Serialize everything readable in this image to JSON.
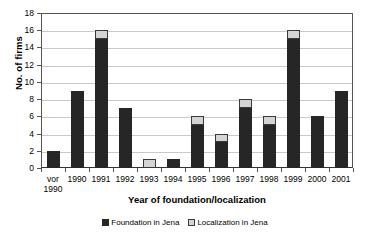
{
  "chart_data": {
    "type": "bar",
    "stacked": true,
    "title": "",
    "xlabel": "Year of foundation/localization",
    "ylabel": "No. of firms",
    "categories": [
      "vor\n1990",
      "1990",
      "1991",
      "1992",
      "1993",
      "1994",
      "1995",
      "1996",
      "1997",
      "1998",
      "1999",
      "2000",
      "2001"
    ],
    "series": [
      {
        "name": "Foundation in Jena",
        "color": "#262626",
        "values": [
          2,
          9,
          15,
          7,
          0,
          1,
          5,
          3,
          7,
          5,
          15,
          6,
          9
        ]
      },
      {
        "name": "Localization in Jena",
        "color": "#d4d4d4",
        "values": [
          0,
          0,
          1,
          0,
          1,
          0,
          1,
          1,
          1,
          1,
          1,
          0,
          0
        ]
      }
    ],
    "totals": [
      2,
      9,
      16,
      7,
      1,
      1,
      6,
      4,
      8,
      6,
      16,
      6,
      9
    ],
    "ylim": [
      0,
      18
    ],
    "yticks": [
      0,
      2,
      4,
      6,
      8,
      10,
      12,
      14,
      16,
      18
    ],
    "ytick_labels": [
      "0",
      "2",
      "4",
      "6",
      "8",
      "10",
      "12",
      "14",
      "16",
      "18"
    ],
    "grid": "horizontal",
    "legend_position": "bottom"
  },
  "legend": {
    "items": [
      {
        "label": "Foundation in Jena",
        "swatch": "dark-square-icon"
      },
      {
        "label": "Localization in Jena",
        "swatch": "light-square-icon"
      }
    ]
  }
}
